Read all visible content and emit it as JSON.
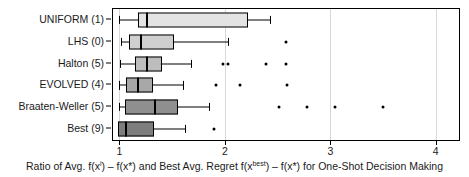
{
  "chart_data": {
    "type": "boxplot",
    "title": "",
    "xlabel": "Ratio of Avg. f(x i) – f(x*) and Best Avg. Regret f(x best) – f(x*) for One-Shot Decision Making",
    "ylabel": "",
    "xlim": [
      0.94,
      4.22
    ],
    "ylim": [
      0,
      6
    ],
    "grid": true,
    "grid_axis": "x",
    "legend": "none",
    "xticks": [
      "1",
      "2",
      "3",
      "4"
    ],
    "xtickvalues": [
      1,
      2,
      3,
      4
    ],
    "categories": [
      "UNIFORM (1)",
      "LHS (0)",
      "Halton (5)",
      "EVOLVED (4)",
      "Braaten-Weller (5)",
      "Best (9)"
    ],
    "boxes": [
      {
        "label": "UNIFORM (1)",
        "fill": "#e3e3e3",
        "whisker_low": 1.0,
        "q1": 1.18,
        "median": 1.26,
        "q3": 2.22,
        "whisker_high": 2.43,
        "outliers": []
      },
      {
        "label": "LHS (0)",
        "fill": "#cfcfcf",
        "whisker_low": 1.02,
        "q1": 1.09,
        "median": 1.21,
        "q3": 1.52,
        "whisker_high": 2.03,
        "outliers": [
          2.58
        ]
      },
      {
        "label": "Halton (5)",
        "fill": "#bdbdbd",
        "whisker_low": 1.01,
        "q1": 1.15,
        "median": 1.26,
        "q3": 1.4,
        "whisker_high": 1.68,
        "outliers": [
          1.98,
          2.03,
          2.39,
          2.58
        ]
      },
      {
        "label": "EVOLVED (4)",
        "fill": "#a8a8a8",
        "whisker_low": 1.0,
        "q1": 1.06,
        "median": 1.18,
        "q3": 1.32,
        "whisker_high": 1.6,
        "outliers": [
          1.92,
          2.14,
          2.59
        ]
      },
      {
        "label": "Braaten-Weller (5)",
        "fill": "#8f8f8f",
        "whisker_low": 1.0,
        "q1": 1.05,
        "median": 1.34,
        "q3": 1.56,
        "whisker_high": 1.85,
        "outliers": [
          2.51,
          2.78,
          3.04,
          3.5
        ]
      },
      {
        "label": "Best (9)",
        "fill": "#7d7d7d",
        "whisker_low": 0.99,
        "q1": 0.99,
        "median": 1.06,
        "q3": 1.33,
        "whisker_high": 1.62,
        "outliers": [
          1.9
        ]
      }
    ]
  },
  "caption": {
    "part1": "Ratio of Avg. f(x",
    "sup1": "i",
    "part2": ") – f(x*) and Best Avg. Regret f(x",
    "sup2": "best",
    "part3": ") – f(x*) for One-Shot Decision Making"
  }
}
